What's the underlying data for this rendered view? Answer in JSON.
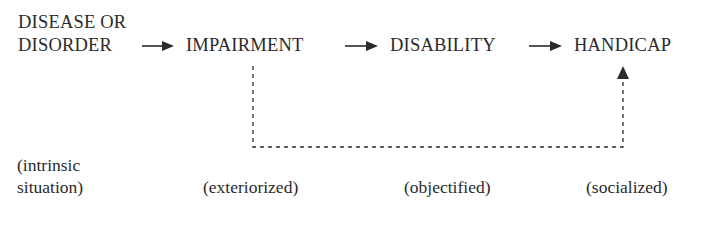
{
  "diagram": {
    "type": "flow",
    "nodes": [
      {
        "id": "disease",
        "line1": "DISEASE OR",
        "line2": "DISORDER",
        "label": "(intrinsic",
        "label2": "situation)"
      },
      {
        "id": "impairment",
        "text": "IMPAIRMENT",
        "label": "(exteriorized)"
      },
      {
        "id": "disability",
        "text": "DISABILITY",
        "label": "(objectified)"
      },
      {
        "id": "handicap",
        "text": "HANDICAP",
        "label": "(socialized)"
      }
    ],
    "edges": [
      {
        "from": "disease",
        "to": "impairment",
        "style": "solid"
      },
      {
        "from": "impairment",
        "to": "disability",
        "style": "solid"
      },
      {
        "from": "disability",
        "to": "handicap",
        "style": "solid"
      },
      {
        "from": "impairment",
        "to": "handicap",
        "style": "dashed"
      }
    ],
    "colors": {
      "ink": "#2a2a2a",
      "background": "#ffffff"
    }
  }
}
